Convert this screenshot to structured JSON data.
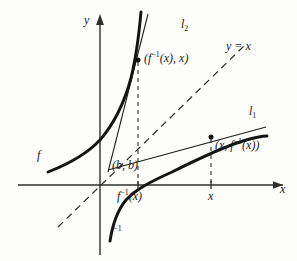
{
  "figure": {
    "kind": "inverse-function-tangent-line-diagram",
    "axes": {
      "x_axis_label": "x",
      "y_axis_label": "y"
    },
    "ticks": {
      "x": [
        {
          "id": "tick-finv-x",
          "label_html": "f<sup>−1</sup>(x)",
          "label_text": "f⁻¹(x)"
        },
        {
          "id": "tick-x",
          "label_html": "x",
          "label_text": "x"
        }
      ]
    },
    "curves": [
      {
        "id": "curve-f",
        "label_html": "f",
        "label_text": "f",
        "style": "solid-bold"
      },
      {
        "id": "curve-f-inverse",
        "label_html": "f<sup>−1</sup>",
        "label_text": "f⁻¹",
        "style": "solid-bold"
      }
    ],
    "lines": [
      {
        "id": "line-l1",
        "label_html": "l<sub>1</sub>",
        "label_text": "l₁",
        "style": "solid-thin"
      },
      {
        "id": "line-l2",
        "label_html": "l<sub>2</sub>",
        "label_text": "l₂",
        "style": "solid-thin"
      },
      {
        "id": "line-y-equals-x",
        "label_html": "y = x",
        "label_text": "y = x",
        "style": "dashed"
      }
    ],
    "points": [
      {
        "id": "point-upper",
        "label_html": "(f<sup>−1</sup>(x), x)",
        "label_text": "(f⁻¹(x), x)"
      },
      {
        "id": "point-lower",
        "label_html": "(x, f<sup>−1</sup>(x))",
        "label_text": "(x, f⁻¹(x))"
      },
      {
        "id": "point-bb",
        "label_html": "(b, b)",
        "label_text": "(b, b)"
      }
    ],
    "colors": {
      "ink": "#1a1a1a",
      "axis": "#3a3a3a",
      "background": "#fdfdfb"
    }
  },
  "chart_data": {
    "type": "line",
    "title": "",
    "xlabel": "x",
    "ylabel": "y",
    "grid": false,
    "legend": "none",
    "origin_px": [
      100,
      185
    ],
    "axis_ranges_px": {
      "x": [
        18,
        288
      ],
      "y": [
        14,
        255
      ]
    },
    "series": [
      {
        "name": "f",
        "style": "solid-bold",
        "points_px": [
          [
            48,
            172
          ],
          [
            62,
            166
          ],
          [
            78,
            157
          ],
          [
            93,
            146
          ],
          [
            105,
            133
          ],
          [
            116,
            116
          ],
          [
            125,
            94
          ],
          [
            132,
            68
          ],
          [
            137,
            42
          ],
          [
            140,
            20
          ],
          [
            141,
            12
          ]
        ]
      },
      {
        "name": "f⁻¹",
        "style": "solid-bold",
        "points_px": [
          [
            110,
            240
          ],
          [
            113,
            226
          ],
          [
            118,
            212
          ],
          [
            125,
            200
          ],
          [
            137,
            190
          ],
          [
            152,
            182
          ],
          [
            170,
            173
          ],
          [
            190,
            163
          ],
          [
            211,
            152
          ],
          [
            232,
            144
          ],
          [
            252,
            139
          ],
          [
            266,
            137
          ]
        ]
      },
      {
        "name": "y = x",
        "style": "dashed",
        "points_px": [
          [
            58,
            227
          ],
          [
            246,
            44
          ]
        ]
      },
      {
        "name": "l₂ (tangent at (b,b) to f)",
        "style": "solid-thin",
        "points_px": [
          [
            110,
            168
          ],
          [
            138,
            60
          ],
          [
            147,
            16
          ]
        ]
      },
      {
        "name": "l₁ (tangent at (b,b) to f⁻¹)",
        "style": "solid-thin",
        "points_px": [
          [
            110,
            168
          ],
          [
            211,
            137
          ],
          [
            264,
            128
          ]
        ]
      }
    ],
    "markers_px": [
      {
        "name": "(f⁻¹(x), x)",
        "x": 138,
        "y": 60
      },
      {
        "name": "(x, f⁻¹(x))",
        "x": 211,
        "y": 137
      },
      {
        "name": "(b, b)",
        "x": 110,
        "y": 168
      }
    ],
    "dashed_drop_lines_px": [
      {
        "from": [
          138,
          60
        ],
        "to": [
          138,
          185
        ]
      },
      {
        "from": [
          211,
          137
        ],
        "to": [
          211,
          185
        ]
      }
    ]
  }
}
